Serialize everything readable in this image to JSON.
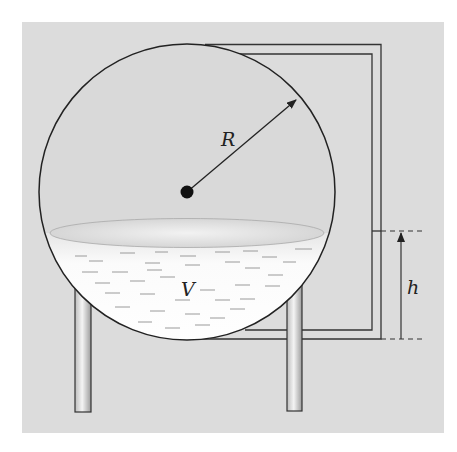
{
  "figure": {
    "type": "spherical-tank-diagram",
    "labels": {
      "radius": "R",
      "volume": "V",
      "height": "h"
    },
    "colors": {
      "background": "#ffffff",
      "panel": "#dcdcdc",
      "tank_fill": "#d8d8d8",
      "liquid": "#f8f8f8",
      "stroke": "#333333"
    }
  }
}
